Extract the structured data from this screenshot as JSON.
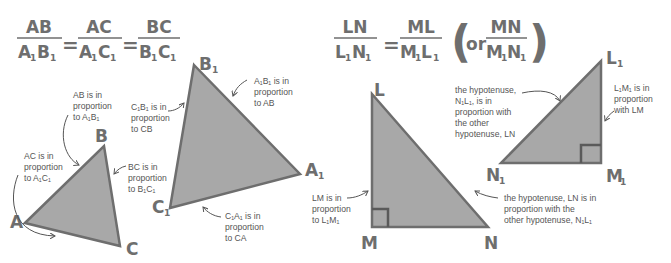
{
  "colors": {
    "fill": "#a8a8a8",
    "stroke": "#6e6e6e",
    "text": "#6e6e6e",
    "note": "#555555"
  },
  "left_formula": {
    "fractions": [
      {
        "num": "AB",
        "den_a": "A",
        "den_b": "B"
      },
      {
        "num": "AC",
        "den_a": "A",
        "den_b": "C"
      },
      {
        "num": "BC",
        "den_a": "B",
        "den_b": "C"
      }
    ],
    "equals": "=",
    "subscript": "1"
  },
  "right_formula": {
    "fractions": [
      {
        "num": "LN",
        "den_a": "L",
        "den_b": "N"
      },
      {
        "num": "ML",
        "den_a": "M",
        "den_b": "L"
      }
    ],
    "alt_prefix": "or",
    "alt_fraction": {
      "num": "MN",
      "den_a": "M",
      "den_b": "N"
    },
    "equals": "=",
    "subscript": "1"
  },
  "triangle_abc": {
    "vertices": {
      "A": "A",
      "B": "B",
      "C": "C"
    },
    "notes": {
      "ab": [
        "AB is in",
        "proportion",
        "to A₁B₁"
      ],
      "ac": [
        "AC is in",
        "proportion",
        "to A₁C₁"
      ],
      "bc": [
        "BC is in",
        "proportion",
        "to B₁C₁"
      ]
    }
  },
  "triangle_a1b1c1": {
    "vertices": {
      "A1": "A",
      "B1": "B",
      "C1": "C"
    },
    "subscript": "1",
    "notes": {
      "c1b1": [
        "C₁B₁ is in",
        "proportion",
        "to CB"
      ],
      "a1b1": [
        "A₁B₁ is in",
        "proportion",
        "to AB"
      ],
      "c1a1": [
        "C₁A₁ is in",
        "proportion",
        "to CA"
      ]
    }
  },
  "triangle_lmn": {
    "vertices": {
      "L": "L",
      "M": "M",
      "N": "N"
    },
    "notes": {
      "lm": [
        "LM is in",
        "proportion",
        "to L₁M₁"
      ],
      "ln": [
        "the hypotenuse, LN is in",
        "proportion with the",
        "other hypotenuse, N₁L₁"
      ]
    }
  },
  "triangle_l1m1n1": {
    "vertices": {
      "L1": "L",
      "M1": "M",
      "N1": "N"
    },
    "subscript": "1",
    "notes": {
      "n1l1": [
        "the hypotenuse,",
        "N₁L₁, is in",
        "proportion with",
        "the other",
        "hypotenuse, LN"
      ],
      "l1m1": [
        "L₁M₁ is in",
        "proportion",
        "with LM"
      ]
    }
  }
}
